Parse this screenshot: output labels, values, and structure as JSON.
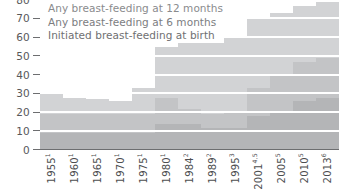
{
  "chart_data": {
    "type": "bar",
    "title": "",
    "subtitle": "",
    "xlabel": "",
    "ylabel": "",
    "ylim": [
      0,
      80
    ],
    "grid": true,
    "legend_position": "top-left",
    "y_ticks": [
      80,
      70,
      60,
      50,
      40,
      30,
      20,
      10,
      0
    ],
    "categories": [
      "1955",
      "1960",
      "1965",
      "1970",
      "1975",
      "1980",
      "1984",
      "1989",
      "1995",
      "2001",
      "2005",
      "2010",
      "2013"
    ],
    "category_footnotes": [
      "1",
      "1",
      "1",
      "1",
      "1",
      "1",
      "2",
      "2",
      "3",
      "4,5",
      "5",
      "5",
      "6"
    ],
    "series": [
      {
        "name": "Initiated breast-feeding at birth",
        "color": "#d2d3d5",
        "values": [
          30,
          28,
          27,
          26,
          33,
          55,
          57,
          57,
          60,
          70,
          73,
          77,
          79
        ]
      },
      {
        "name": "Any breast-feeding at 6 months",
        "color": "#c3c4c6",
        "values": [
          19,
          19,
          19,
          19,
          19,
          28,
          22,
          19,
          21,
          33,
          40,
          47,
          49
        ]
      },
      {
        "name": "Any breast-feeding at 12 months",
        "color": "#b4b5b7",
        "values": [
          9,
          9,
          9,
          9,
          9,
          14,
          14,
          12,
          12,
          18,
          21,
          26,
          28
        ]
      }
    ]
  },
  "legend": {
    "items": [
      {
        "label": "Any breast-feeding at 12 months"
      },
      {
        "label": "Any breast-feeding at 6 months"
      },
      {
        "label": "Initiated breast-feeding at birth"
      }
    ]
  },
  "axis": {
    "y_labels": [
      "80",
      "70",
      "60",
      "50",
      "40",
      "30",
      "20",
      "10",
      "0"
    ]
  }
}
